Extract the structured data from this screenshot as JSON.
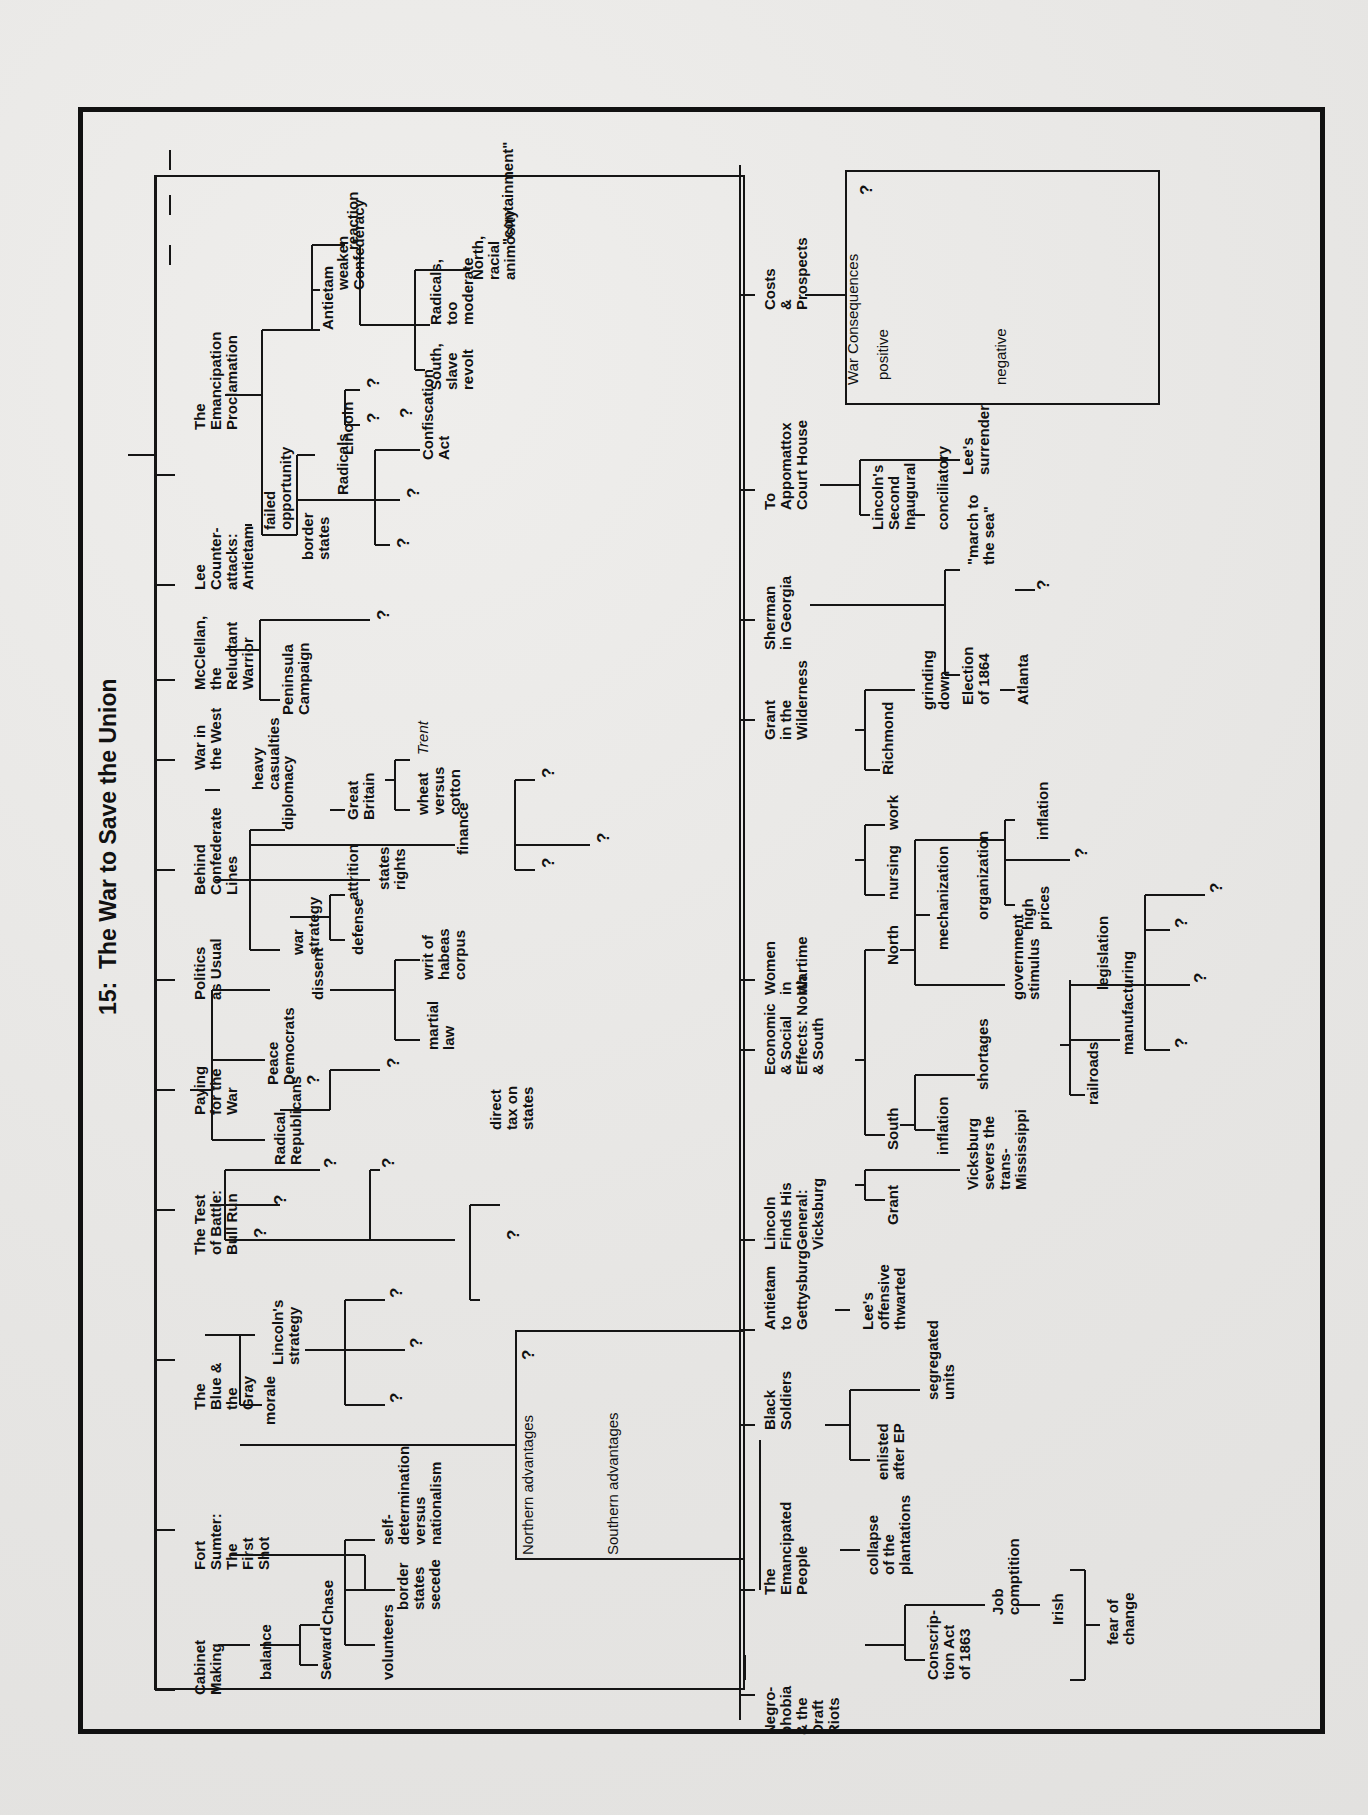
{
  "title": "15:  The War to Save the Union",
  "top_branch": {
    "topics": [
      {
        "label": "Cabinet\nMaking",
        "children": [
          "balance",
          "Seward",
          "Chase"
        ]
      },
      {
        "label": "Fort\nSumter:\nThe\nFirst\nShot",
        "children": [
          "volunteers",
          "border\nstates\nsecede",
          "self-\ndetermination\nversus\nnationalism"
        ]
      },
      {
        "label": "The\nBlue &\nthe\nGray",
        "box": {
          "q": "?",
          "north": "Northern advantages",
          "south": "Southern advantages"
        }
      },
      {
        "label": "The Test\nof Battle:\nBull Run",
        "children": [
          "morale",
          "Lincoln's\nstrategy",
          "?",
          "?",
          "?"
        ]
      },
      {
        "label": "Paying\nfor the\nWar",
        "children": [
          "?",
          "?",
          "?",
          "direct\ntax on\nstates",
          "?",
          "?"
        ]
      },
      {
        "label": "Politics\nas Usual",
        "children": [
          "Radical\nRepublicans",
          "Peace\nDemocrats",
          "?",
          "?",
          "dissent",
          "martial\nlaw",
          "writ of\nhabeas\ncorpus"
        ]
      },
      {
        "label": "Behind\nConfederate\nLines",
        "children": [
          "war\nstrategy",
          "defense",
          "attrition",
          "states'\nrights",
          "finance",
          "?",
          "?",
          "?",
          "diplomacy",
          "Great\nBritain",
          "wheat\nversus\ncotton",
          "Trent"
        ]
      },
      {
        "label": "War in\nthe West",
        "children": [
          "heavy\ncasualties"
        ]
      },
      {
        "label": "McClellan,\nthe\nReluctant\nWarrior",
        "children": [
          "Peninsula\nCampaign",
          "?"
        ]
      },
      {
        "label": "Lee\nCounter-\nattacks:\nAntietam",
        "children": [
          "failed\nopportunity"
        ]
      },
      {
        "label": "The\nEmancipation\nProclamation",
        "children": [
          "border\nstates",
          "Radicals",
          "?",
          "?",
          "Confiscation\nAct",
          "Lincoln",
          "?",
          "?",
          "?",
          "Antietam",
          "weaken\nConfederacy",
          "reaction",
          "South,\nslave\nrevolt",
          "Radicals,\ntoo\nmoderate",
          "North,\nracial\nanimosity",
          "\"containment\""
        ]
      }
    ]
  },
  "bottom_branch": {
    "topics": [
      {
        "label": "Negro-\nphobia\n& the\nDraft\nRiots",
        "children": [
          "Conscrip-\ntion Act\nof 1863",
          "Job\ncomptition",
          "Irish",
          "fear of\nchange"
        ]
      },
      {
        "label": "The\nEmancipated\nPeople",
        "children": [
          "collapse\nof the\nplantations"
        ]
      },
      {
        "label": "Black\nSoldiers",
        "children": [
          "enlisted\nafter EP",
          "segregated\nunits"
        ]
      },
      {
        "label": "Antietam\nto\nGettysburg",
        "children": [
          "Lee's\noffensive\nthwarted"
        ]
      },
      {
        "label": "Lincoln\nFinds His\nGeneral:\nVicksburg",
        "children": [
          "Grant",
          "Vicksburg\nsevers the\ntrans-\nMississippi"
        ]
      },
      {
        "label": "Economic\n& Social\nEffects: North\n& South",
        "children": [
          "South",
          "inflation",
          "shortages",
          "North",
          "mechanization",
          "organization",
          "government\nstimulus",
          "high\nprices",
          "?",
          "inflation",
          "railroads",
          "manufacturing",
          "legislation",
          "?",
          "?",
          "?",
          "?"
        ]
      },
      {
        "label": "Women\nin\nWartime",
        "children": [
          "nursing",
          "work"
        ]
      },
      {
        "label": "Grant\nin the\nWilderness",
        "children": [
          "Richmond",
          "grinding\ndown"
        ]
      },
      {
        "label": "Sherman\nin Georgia",
        "children": [
          "Election\nof 1864",
          "Atlanta",
          "\"march to\nthe sea\"",
          "?"
        ]
      },
      {
        "label": "To\nAppomattox\nCourt House",
        "children": [
          "Lincoln's\nSecond\nInaugural",
          "conciliatory",
          "Lee's\nsurrender"
        ]
      },
      {
        "label": "Costs\n&\nProspects",
        "box": {
          "title": "War Consequences",
          "q": "?",
          "positive": "positive",
          "negative": "negative"
        }
      }
    ]
  }
}
